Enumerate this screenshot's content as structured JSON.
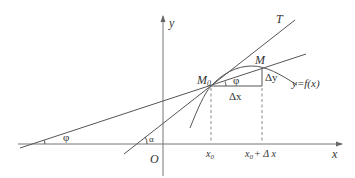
{
  "diagram": {
    "title": "",
    "colors": {
      "line": "#555555",
      "axis": "#777777",
      "text": "#333333",
      "background": "#ffffff"
    },
    "axes": {
      "x_label": "x",
      "y_label": "y",
      "origin_label": "O"
    },
    "points": {
      "m0_label": "M",
      "m0_subscript": "0",
      "m_label": "M"
    },
    "lines": {
      "tangent_label": "T",
      "curve_label": "y=f(x)"
    },
    "increments": {
      "dx_label": "Δx",
      "dy_label": "Δy"
    },
    "angles": {
      "secant_angle_label": "φ",
      "secant_angle_at_m0_label": "φ",
      "tangent_angle_label": "α"
    },
    "ticks": {
      "x0_label": "x",
      "x0_subscript": "0",
      "x0_plus_dx_prefix": "x",
      "x0_plus_dx_subscript": "0",
      "x0_plus_dx_suffix": "+ Δ x"
    }
  }
}
